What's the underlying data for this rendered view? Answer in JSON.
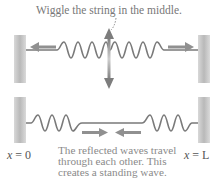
{
  "top_panel": {
    "instruction": "Wiggle the string in the middle."
  },
  "bottom_panel": {
    "label_left_var": "x",
    "label_left_rest": " = 0",
    "label_right_var": "x",
    "label_right_rest": " = L",
    "caption": [
      "The reflected waves travel",
      "through each other. This",
      "creates a standing wave."
    ]
  },
  "colors": {
    "wall": "#c8c8c8",
    "string": "#7a7a7a",
    "arrow": "#8f8f8f"
  }
}
